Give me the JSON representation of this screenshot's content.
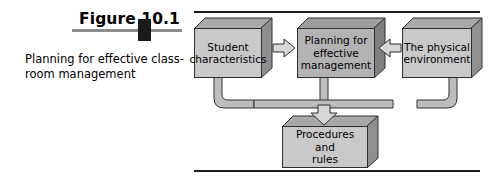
{
  "figure": {
    "number_label": "Figure 10.1",
    "caption": "Planning for effective class-\nroom management"
  },
  "diagram": {
    "type": "flowchart",
    "boxes": [
      {
        "id": "student-characteristics",
        "label": "Student\ncharacteristics",
        "position": "top-left"
      },
      {
        "id": "planning-effective-management",
        "label": "Planning for\neffective\nmanagement",
        "position": "top-center"
      },
      {
        "id": "physical-environment",
        "label": "The physical\nenvironment",
        "position": "top-right"
      },
      {
        "id": "procedures-and-rules",
        "label": "Procedures\nand\nrules",
        "position": "bottom-center"
      }
    ],
    "arrows": [
      {
        "id": "student-to-planning",
        "from": "student-characteristics",
        "to": "planning-effective-management",
        "direction": "right"
      },
      {
        "id": "environment-to-planning",
        "from": "physical-environment",
        "to": "planning-effective-management",
        "direction": "left"
      },
      {
        "id": "all-to-procedures",
        "from": "student-characteristics, planning-effective-management, physical-environment",
        "to": "procedures-and-rules",
        "direction": "down"
      }
    ]
  },
  "colors": {
    "box_face": "#c9c9c9",
    "box_face_dark": "#b3b3b3",
    "box_top": "#a8a8a8",
    "box_side": "#8f8f8f",
    "outline": "#2e2e2e",
    "rule": "#1c1c1c",
    "caption_bar": "#8c8c8c",
    "caption_knob": "#1a1a1a",
    "arrow_fill": "#d7d7d7",
    "pipe_fill": "#bdbdbd"
  }
}
